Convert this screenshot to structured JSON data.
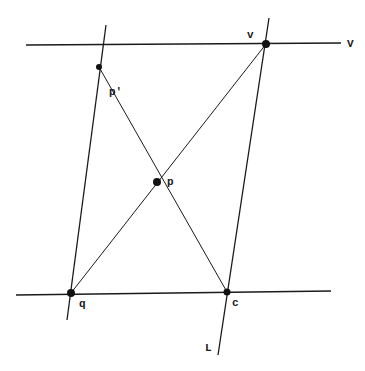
{
  "diagram": {
    "labels": {
      "v_point": "v",
      "V_line": "V",
      "p_prime": "p'",
      "p": "p",
      "q": "q",
      "c": "c",
      "L_line": "L"
    },
    "points": {
      "v": [
        266,
        44
      ],
      "p_prime": [
        99,
        67
      ],
      "p": [
        157,
        182
      ],
      "q": [
        71,
        293
      ],
      "c": [
        227,
        292
      ]
    },
    "lines": {
      "V": {
        "from": [
          26,
          45
        ],
        "to": [
          341,
          43
        ]
      },
      "bottom": {
        "from": [
          16,
          295
        ],
        "to": [
          331,
          291
        ]
      },
      "L": {
        "from": [
          269,
          18
        ],
        "to": [
          218,
          355
        ]
      },
      "left": {
        "from": [
          106,
          25
        ],
        "to": [
          67,
          320
        ]
      },
      "qv": {
        "from": [
          71,
          293
        ],
        "to": [
          266,
          44
        ]
      },
      "pprime_c": {
        "from": [
          99,
          67
        ],
        "to": [
          227,
          292
        ]
      }
    }
  }
}
